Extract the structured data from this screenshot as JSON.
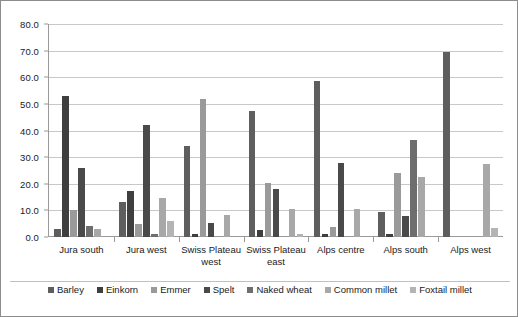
{
  "chart_data": {
    "type": "bar",
    "title": "",
    "subtitle": "",
    "xlabel": "",
    "ylabel": "",
    "ylim": [
      0,
      80
    ],
    "ytick_labels": [
      "0.0",
      "10.0",
      "20.0",
      "30.0",
      "40.0",
      "50.0",
      "60.0",
      "70.0",
      "80.0"
    ],
    "ytick_values": [
      0,
      10,
      20,
      30,
      40,
      50,
      60,
      70,
      80
    ],
    "grid": true,
    "legend_position": "bottom",
    "categories": [
      "Jura south",
      "Jura west",
      "Swiss Plateau west",
      "Swiss Plateau east",
      "Alps centre",
      "Alps south",
      "Alps west"
    ],
    "series": [
      {
        "name": "Barley",
        "color": "#5e5e5e",
        "values": [
          3.0,
          13.3,
          34.0,
          47.5,
          58.6,
          9.5,
          69.6
        ]
      },
      {
        "name": "Einkorn",
        "color": "#3f3f3f",
        "values": [
          52.8,
          17.4,
          1.0,
          2.6,
          1.0,
          1.0,
          0.0
        ]
      },
      {
        "name": "Emmer",
        "color": "#9a9a9a",
        "values": [
          10.2,
          4.9,
          52.0,
          20.3,
          3.7,
          24.0,
          0.0
        ]
      },
      {
        "name": "Spelt",
        "color": "#4a4a4a",
        "values": [
          25.9,
          42.0,
          5.1,
          18.0,
          27.7,
          7.9,
          0.0
        ]
      },
      {
        "name": "Naked wheat",
        "color": "#6e6e6e",
        "values": [
          4.0,
          1.0,
          0.0,
          0.0,
          0.0,
          36.5,
          0.0
        ]
      },
      {
        "name": "Common millet",
        "color": "#a8a8a8",
        "values": [
          3.1,
          14.8,
          8.1,
          10.4,
          10.4,
          22.5,
          27.6
        ]
      },
      {
        "name": "Foxtail millet",
        "color": "#b4b4b4",
        "values": [
          0.0,
          6.1,
          0.0,
          1.1,
          0.0,
          0.0,
          3.5
        ]
      }
    ]
  }
}
